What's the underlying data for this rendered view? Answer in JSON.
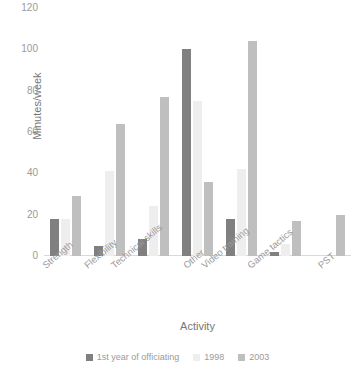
{
  "chart_data": {
    "type": "bar",
    "title": "",
    "xlabel": "Activity",
    "ylabel": "Minutes/week",
    "ylim": [
      0,
      120
    ],
    "yticks": [
      0,
      20,
      40,
      60,
      80,
      100,
      120
    ],
    "grid": false,
    "legend_position": "bottom",
    "categories": [
      "Strength",
      "Flexibility",
      "Technical skills",
      "Other",
      "Video training",
      "Game tactics",
      "PST"
    ],
    "series": [
      {
        "name": "1st year of officiating",
        "color": "#808080",
        "values": [
          18,
          5,
          8,
          100,
          18,
          2,
          0
        ]
      },
      {
        "name": "1998",
        "color": "#eeeeee",
        "values": [
          18,
          41,
          24,
          75,
          42,
          6,
          0
        ]
      },
      {
        "name": "2003",
        "color": "#bfbfbf",
        "values": [
          29,
          64,
          77,
          36,
          104,
          17,
          20
        ]
      }
    ]
  },
  "axes": {
    "y_title": "Minutes/week",
    "x_title": "Activity",
    "y_tick_labels": [
      "120",
      "100",
      "80",
      "60",
      "40",
      "20",
      "0"
    ],
    "x_tick_labels": [
      "Strength",
      "Flexibility",
      "Technical skills",
      "Other",
      "Video training",
      "Game tactics",
      "PST"
    ]
  },
  "legend": {
    "items": [
      {
        "label": "1st year of officiating",
        "color": "#808080"
      },
      {
        "label": "1998",
        "color": "#eeeeee"
      },
      {
        "label": "2003",
        "color": "#bfbfbf"
      }
    ]
  }
}
